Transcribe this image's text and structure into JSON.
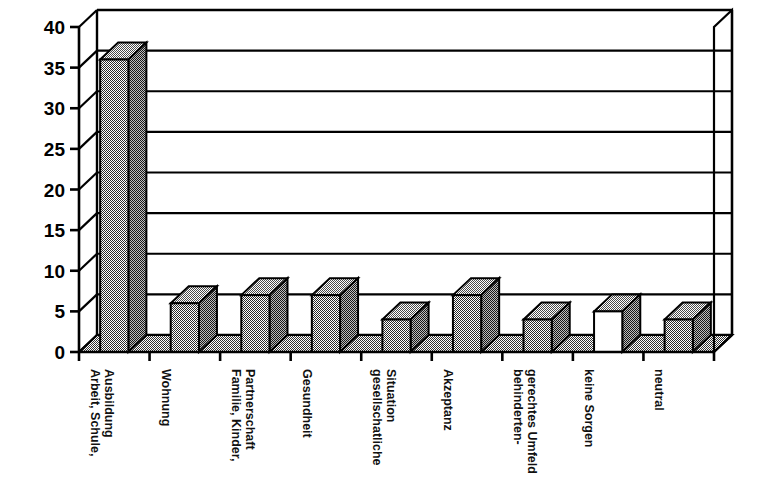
{
  "chart_data": {
    "type": "bar",
    "title": "",
    "subtitle": "",
    "xlabel": "",
    "ylabel": "",
    "ylim": [
      0,
      40
    ],
    "ytick_step": 5,
    "yticks": [
      "0",
      "5",
      "10",
      "15",
      "20",
      "25",
      "30",
      "35",
      "40"
    ],
    "grid": true,
    "grid_axis": "y",
    "legend": "none",
    "style": "3d-column",
    "categories": [
      "Arbeit, Schule, Ausbildung",
      "Wohnung",
      "Familie, Kinder, Partnerschaft",
      "Gesundheit",
      "gesellschatliche Situation",
      "Akzeptanz",
      "behindertengerechtes Umfeld",
      "keine Sorgen",
      "neutral"
    ],
    "category_lines": [
      [
        "Arbeit, Schule,",
        "Ausbildung"
      ],
      [
        "Wohnung"
      ],
      [
        "Familie, Kinder,",
        "Partnerschaft"
      ],
      [
        "Gesundheit"
      ],
      [
        "gesellschatliche",
        "Situation"
      ],
      [
        "Akzeptanz"
      ],
      [
        "behinderten-",
        "gerechtes Umfeld"
      ],
      [
        "keine Sorgen"
      ],
      [
        "neutral"
      ]
    ],
    "values": [
      36,
      6,
      7,
      7,
      4,
      7,
      4,
      5,
      4
    ],
    "bar_fill": [
      "hatched",
      "hatched",
      "hatched",
      "hatched",
      "hatched",
      "hatched",
      "hatched",
      "white",
      "hatched"
    ],
    "colors": {
      "bar_front_hatched": "#8a8a8a",
      "bar_front_white": "#ffffff",
      "bar_top": "#9a9a9a",
      "bar_side": "#6e6e6e",
      "floor": "#8a8a8a",
      "axis": "#000000",
      "grid": "#000000",
      "background": "#ffffff"
    }
  }
}
